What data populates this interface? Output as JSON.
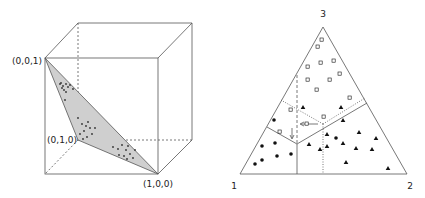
{
  "left_panel": {
    "vertex_labels": {
      "v001": "(0,0,1)",
      "v010": "(0,1,0)",
      "v100": "(1,0,0)"
    },
    "colors": {
      "line": "#555555",
      "fill": "#cfcfcf",
      "dot": "#333333"
    }
  },
  "right_panel": {
    "corner_labels": {
      "c1": "1",
      "c2": "2",
      "c3": "3"
    },
    "legend_symbols": [
      "filled-circle",
      "open-square",
      "filled-triangle"
    ],
    "colors": {
      "line": "#555555",
      "marker": "#111111"
    }
  }
}
